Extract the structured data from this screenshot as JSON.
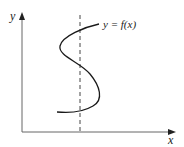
{
  "diagram": {
    "y_axis_label": "y",
    "x_axis_label": "x",
    "curve_label": "y = f(x)",
    "vertical_line": "dashed vertical line",
    "colors": {
      "axis": "#555555",
      "curve": "#1a1a1a",
      "dashed": "#444444",
      "text": "#222222"
    }
  }
}
